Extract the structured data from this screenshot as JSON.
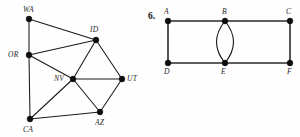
{
  "page": {
    "background_color": "#fefefe",
    "width": 300,
    "height": 137
  },
  "figures": [
    {
      "id": "state-adjacency-graph",
      "figure_number": "",
      "description": "Undirected graph of western US state adjacencies",
      "vertices": [
        {
          "id": "WA",
          "label": "WA",
          "x": 29,
          "y": 19,
          "label_x": 23,
          "label_y": 12
        },
        {
          "id": "OR",
          "label": "OR",
          "x": 29,
          "y": 55,
          "label_x": 8,
          "label_y": 57
        },
        {
          "id": "ID",
          "label": "ID",
          "x": 96,
          "y": 40,
          "label_x": 90,
          "label_y": 32
        },
        {
          "id": "NV",
          "label": "NV",
          "x": 73,
          "y": 79,
          "label_x": 54,
          "label_y": 81
        },
        {
          "id": "UT",
          "label": "UT",
          "x": 122,
          "y": 79,
          "label_x": 127,
          "label_y": 81
        },
        {
          "id": "AZ",
          "label": "AZ",
          "x": 100,
          "y": 112,
          "label_x": 95,
          "label_y": 125
        },
        {
          "id": "CA",
          "label": "CA",
          "x": 30,
          "y": 119,
          "label_x": 23,
          "label_y": 132
        }
      ],
      "edges": [
        {
          "from": "WA",
          "to": "OR"
        },
        {
          "from": "WA",
          "to": "ID"
        },
        {
          "from": "OR",
          "to": "ID"
        },
        {
          "from": "OR",
          "to": "NV"
        },
        {
          "from": "OR",
          "to": "CA"
        },
        {
          "from": "ID",
          "to": "NV"
        },
        {
          "from": "ID",
          "to": "UT"
        },
        {
          "from": "NV",
          "to": "UT"
        },
        {
          "from": "NV",
          "to": "AZ"
        },
        {
          "from": "NV",
          "to": "CA"
        },
        {
          "from": "UT",
          "to": "AZ"
        },
        {
          "from": "AZ",
          "to": "CA"
        }
      ]
    },
    {
      "id": "multigraph-abcdef",
      "figure_number": "6.",
      "figure_number_x": 148,
      "figure_number_y": 19,
      "description": "Multigraph with vertices A-F and a double edge between B and E",
      "vertices": [
        {
          "id": "A",
          "label": "A",
          "x": 168,
          "y": 21,
          "label_x": 164,
          "label_y": 14
        },
        {
          "id": "B",
          "label": "B",
          "x": 225,
          "y": 21,
          "label_x": 222,
          "label_y": 14
        },
        {
          "id": "C",
          "label": "C",
          "x": 290,
          "y": 21,
          "label_x": 286,
          "label_y": 14
        },
        {
          "id": "D",
          "label": "D",
          "x": 168,
          "y": 63,
          "label_x": 164,
          "label_y": 74
        },
        {
          "id": "E",
          "label": "E",
          "x": 225,
          "y": 63,
          "label_x": 221,
          "label_y": 74
        },
        {
          "id": "F",
          "label": "F",
          "x": 290,
          "y": 63,
          "label_x": 287,
          "label_y": 74
        }
      ],
      "edges": [
        {
          "from": "A",
          "to": "B",
          "style": "straight"
        },
        {
          "from": "B",
          "to": "C",
          "style": "straight"
        },
        {
          "from": "D",
          "to": "E",
          "style": "straight"
        },
        {
          "from": "E",
          "to": "F",
          "style": "straight"
        },
        {
          "from": "A",
          "to": "D",
          "style": "straight"
        },
        {
          "from": "C",
          "to": "F",
          "style": "straight"
        },
        {
          "from": "B",
          "to": "E",
          "style": "curve-left"
        },
        {
          "from": "B",
          "to": "E",
          "style": "curve-right"
        }
      ]
    }
  ]
}
